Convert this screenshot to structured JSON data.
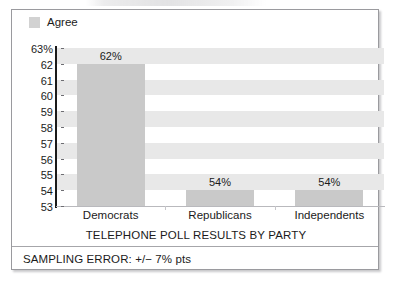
{
  "legend": {
    "entries": [
      {
        "label": "Agree",
        "color": "#d2d2d2"
      }
    ]
  },
  "footer": {
    "note": "SAMPLING ERROR: +/− 7% pts"
  },
  "chart_data": {
    "type": "bar",
    "title": "",
    "xlabel": "TELEPHONE POLL RESULTS BY PARTY",
    "ylabel": "",
    "categories": [
      "Democrats",
      "Republicans",
      "Independents"
    ],
    "values": [
      62,
      54,
      54
    ],
    "value_labels": [
      "62%",
      "54%",
      "54%"
    ],
    "series": [
      {
        "name": "Agree",
        "values": [
          62,
          54,
          54
        ],
        "color": "#c9c9c9"
      }
    ],
    "ylim": [
      53,
      63
    ],
    "yticks": [
      63,
      62,
      61,
      60,
      59,
      58,
      57,
      56,
      55,
      54,
      53
    ],
    "ytick_labels": [
      "63%",
      "62",
      "61",
      "60",
      "59",
      "58",
      "57",
      "56",
      "55",
      "54",
      "53"
    ],
    "grid": "alternating-horizontal-bands",
    "band_color": "#e8e8e8",
    "legend_position": "top-left",
    "annotations": [
      "SAMPLING ERROR: +/− 7% pts"
    ]
  }
}
